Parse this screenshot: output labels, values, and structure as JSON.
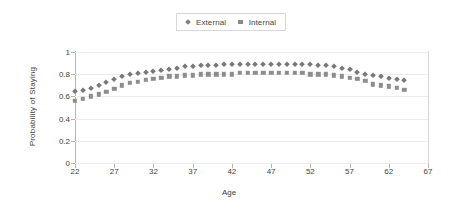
{
  "chart_data": {
    "type": "scatter",
    "title": "",
    "xlabel": "Age",
    "ylabel": "Probability of Staying",
    "xlim": [
      22,
      67
    ],
    "ylim": [
      0,
      1
    ],
    "xticks": [
      22,
      27,
      32,
      37,
      42,
      47,
      52,
      57,
      62,
      67
    ],
    "yticks": [
      0,
      0.2,
      0.4,
      0.6,
      0.8,
      1
    ],
    "ytick_labels": [
      "0",
      "0.2",
      "0.4",
      "0.6",
      "0.8",
      "1"
    ],
    "grid": true,
    "legend_position": "top-center",
    "x": [
      22,
      23,
      24,
      25,
      26,
      27,
      28,
      29,
      30,
      31,
      32,
      33,
      34,
      35,
      36,
      37,
      38,
      39,
      40,
      41,
      42,
      43,
      44,
      45,
      46,
      47,
      48,
      49,
      50,
      51,
      52,
      53,
      54,
      55,
      56,
      57,
      58,
      59,
      60,
      61,
      62,
      63,
      64
    ],
    "series": [
      {
        "name": "External",
        "marker": "diamond",
        "color": "#787878",
        "values": [
          0.65,
          0.66,
          0.68,
          0.7,
          0.73,
          0.76,
          0.78,
          0.8,
          0.81,
          0.82,
          0.83,
          0.84,
          0.85,
          0.86,
          0.87,
          0.87,
          0.88,
          0.88,
          0.88,
          0.89,
          0.89,
          0.89,
          0.89,
          0.89,
          0.89,
          0.89,
          0.89,
          0.89,
          0.89,
          0.89,
          0.89,
          0.88,
          0.88,
          0.87,
          0.86,
          0.85,
          0.82,
          0.8,
          0.79,
          0.78,
          0.77,
          0.76,
          0.75
        ]
      },
      {
        "name": "Internal",
        "marker": "square",
        "color": "#8d8d8d",
        "values": [
          0.56,
          0.58,
          0.6,
          0.62,
          0.64,
          0.67,
          0.7,
          0.72,
          0.73,
          0.75,
          0.76,
          0.77,
          0.78,
          0.78,
          0.79,
          0.79,
          0.8,
          0.8,
          0.8,
          0.8,
          0.8,
          0.81,
          0.81,
          0.81,
          0.81,
          0.81,
          0.81,
          0.81,
          0.81,
          0.81,
          0.8,
          0.8,
          0.8,
          0.79,
          0.78,
          0.77,
          0.76,
          0.74,
          0.71,
          0.7,
          0.69,
          0.68,
          0.66
        ]
      }
    ]
  },
  "legend": {
    "entries": [
      {
        "label": "External"
      },
      {
        "label": "Internal"
      }
    ]
  },
  "axes": {
    "y_title": "Probability of Staying",
    "x_title": "Age"
  }
}
